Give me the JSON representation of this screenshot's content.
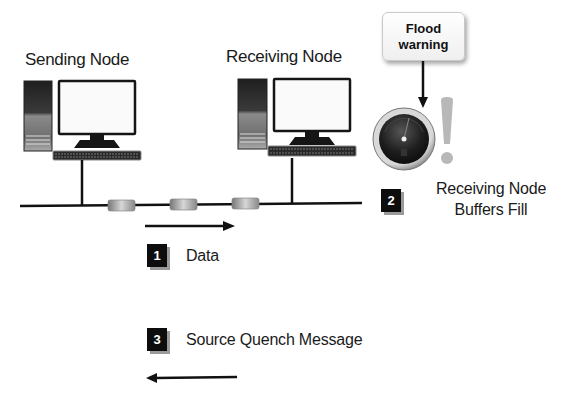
{
  "diagram": {
    "nodes": {
      "sending": {
        "label": "Sending Node"
      },
      "receiving": {
        "label": "Receiving Node"
      }
    },
    "flood_callout": {
      "line1": "Flood",
      "line2": "warning"
    },
    "steps": [
      {
        "number": "1",
        "label": "Data",
        "direction": "right"
      },
      {
        "number": "2",
        "label_line1": "Receiving Node",
        "label_line2": "Buffers Fill"
      },
      {
        "number": "3",
        "label": "Source Quench Message",
        "direction": "left"
      }
    ],
    "packets_count": 3,
    "icons": {
      "computer": "desktop-computer-icon",
      "gauge": "pressure-gauge-icon",
      "alert": "exclamation-icon",
      "packet": "data-packet-icon"
    },
    "colors": {
      "background": "#ffffff",
      "line": "#111111",
      "step_box": "#0d0d0d",
      "exclamation": "#b8b8b8",
      "gauge_face": "#1e1e1e"
    }
  }
}
